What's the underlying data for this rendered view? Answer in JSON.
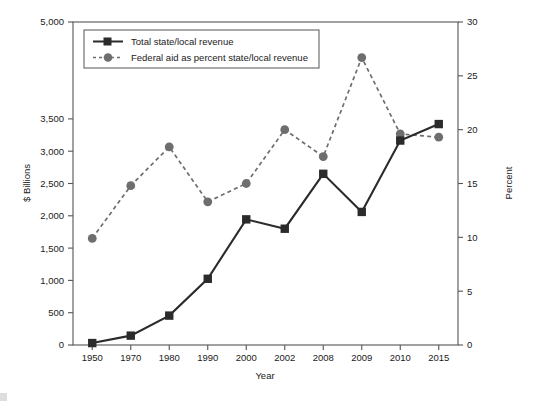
{
  "chart_data": {
    "type": "line",
    "title": "",
    "xlabel": "Year",
    "ylabel": "$ Billions",
    "y2label": "Percent",
    "categories": [
      "1950",
      "1970",
      "1980",
      "1990",
      "2000",
      "2002",
      "2008",
      "2009",
      "2010",
      "2015"
    ],
    "ylim": [
      0,
      5000
    ],
    "y2lim": [
      0,
      30
    ],
    "yticks": [
      "0",
      "500",
      "1,000",
      "1,500",
      "2,000",
      "2,500",
      "3,000",
      "3,500",
      "5,000"
    ],
    "ytick_values": [
      0,
      500,
      1000,
      1500,
      2000,
      2500,
      3000,
      3500,
      5000
    ],
    "y2ticks": [
      "0",
      "5",
      "10",
      "15",
      "20",
      "25",
      "30"
    ],
    "y2tick_values": [
      0,
      5,
      10,
      15,
      20,
      25,
      30
    ],
    "grid": false,
    "legend_position": "top-left",
    "series": [
      {
        "name": "Total state/local revenue",
        "axis": "left",
        "style": "solid",
        "marker": "square",
        "color": "#2b2b2b",
        "values": [
          30,
          145,
          455,
          1025,
          1945,
          1800,
          2650,
          2060,
          3165,
          3420
        ]
      },
      {
        "name": "Federal aid as percent state/local revenue",
        "axis": "right",
        "style": "dashed",
        "marker": "circle",
        "color": "#6e6e6e",
        "values": [
          9.9,
          14.8,
          18.4,
          13.3,
          15.0,
          20.0,
          17.5,
          26.7,
          19.6,
          19.3
        ]
      }
    ]
  },
  "legend": {
    "items": [
      {
        "label": "Total state/local revenue",
        "marker": "square",
        "style": "solid"
      },
      {
        "label": "Federal aid as percent state/local revenue",
        "marker": "circle",
        "style": "dashed"
      }
    ]
  },
  "axes": {
    "x_title": "Year",
    "y_left_title": "$ Billions",
    "y_right_title": "Percent"
  },
  "caption": {
    "label": "",
    "text": ""
  },
  "colors": {
    "series_solid": "#2b2b2b",
    "series_dashed": "#6e6e6e",
    "axis": "#555555",
    "text": "#1a1a1a",
    "background": "#ffffff"
  }
}
